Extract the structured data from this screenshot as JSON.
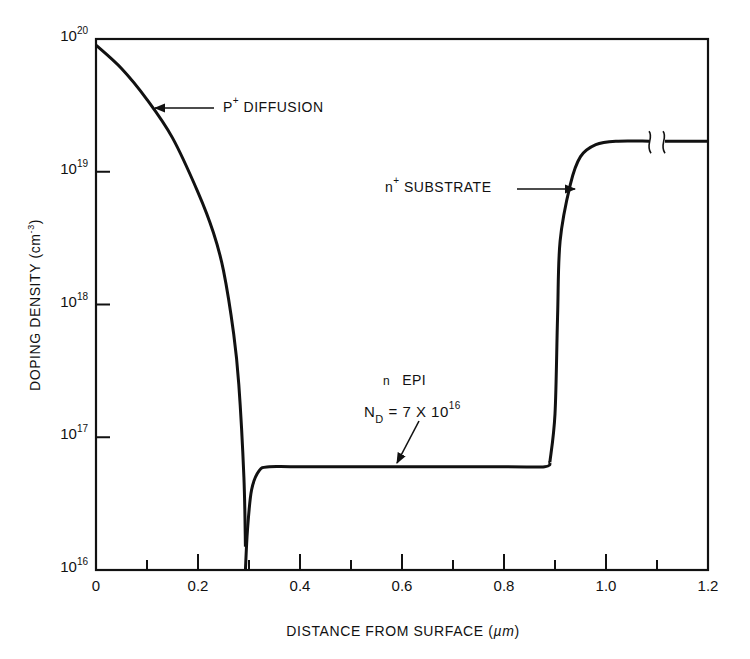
{
  "chart_data": {
    "type": "line",
    "title": "",
    "xlabel": "DISTANCE FROM SURFACE (µm)",
    "ylabel": "DOPING DENSITY (cm-3)",
    "xscale": "linear",
    "yscale": "log",
    "xlim": [
      0,
      1.2
    ],
    "ylim": [
      1e+16,
      1e+20
    ],
    "grid": false,
    "legend": null,
    "x_ticks": [
      0,
      0.2,
      0.4,
      0.6,
      0.8,
      1.0,
      1.2
    ],
    "x_tick_labels": [
      "0",
      "0.2",
      "0.4",
      "0.6",
      "0.8",
      "1.0",
      "1.2"
    ],
    "x_minor_ticks": [
      0.1,
      0.3,
      0.5,
      0.7,
      0.9,
      1.1
    ],
    "y_ticks": [
      1e+16,
      1e+17,
      1e+18,
      1e+19,
      1e+20
    ],
    "y_tick_labels": [
      {
        "base": "10",
        "exp": "16"
      },
      {
        "base": "10",
        "exp": "17"
      },
      {
        "base": "10",
        "exp": "18"
      },
      {
        "base": "10",
        "exp": "19"
      },
      {
        "base": "10",
        "exp": "20"
      }
    ],
    "series": [
      {
        "name": "P+ diffusion",
        "x": [
          0.0,
          0.05,
          0.1,
          0.15,
          0.2,
          0.23,
          0.25,
          0.27,
          0.28,
          0.29,
          0.293
        ],
        "y": [
          9e+19,
          6e+19,
          3.5e+19,
          1.8e+19,
          7e+18,
          3.5e+18,
          1.8e+18,
          6e+17,
          2.5e+17,
          5e+16,
          1.5e+16
        ]
      },
      {
        "name": "n EPI",
        "x": [
          0.293,
          0.297,
          0.305,
          0.32,
          0.34,
          0.4,
          0.6,
          0.8,
          0.88,
          0.89
        ],
        "y": [
          1e+16,
          2e+16,
          4e+16,
          5.6e+16,
          6e+16,
          6e+16,
          6e+16,
          6e+16,
          6e+16,
          6.5e+16
        ]
      },
      {
        "name": "n+ substrate",
        "x": [
          0.89,
          0.9,
          0.905,
          0.91,
          0.93,
          0.95,
          0.98,
          1.02,
          1.1,
          1.2
        ],
        "y": [
          6.5e+16,
          1.5e+17,
          8e+17,
          3e+18,
          8e+18,
          1.3e+19,
          1.6e+19,
          1.7e+19,
          1.7e+19,
          1.7e+19
        ]
      }
    ],
    "annotations": [
      {
        "text": "P+ DIFFUSION",
        "points_to": [
          0.12,
          3e+19
        ]
      },
      {
        "text": "n+ SUBSTRATE",
        "points_to": [
          0.93,
          9e+18
        ]
      },
      {
        "text": "n EPI",
        "points_to": null
      },
      {
        "text": "ND = 7 X 10^16",
        "points_to": [
          0.57,
          6e+16
        ]
      }
    ],
    "axis_break": {
      "x": 1.1,
      "note": "broken-line marks on substrate plateau"
    }
  },
  "labels": {
    "p_diffusion": {
      "main": "P",
      "sup": "+",
      "rest": " DIFFUSION"
    },
    "n_substrate": {
      "main": "n",
      "sup": "+",
      "rest": " SUBSTRATE"
    },
    "n_epi": {
      "main": "n",
      "rest": "EPI"
    },
    "nd": {
      "main": "N",
      "sub": "D",
      "rest": " = 7 X 10",
      "sup": "16"
    },
    "xaxis_title": {
      "text": "DISTANCE FROM SURFACE (",
      "unit": "µm",
      "close": ")"
    },
    "yaxis_title": {
      "text": "DOPING DENSITY (cm",
      "sup": "-3",
      "close": ")"
    }
  }
}
